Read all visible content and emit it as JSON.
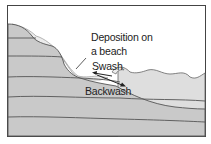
{
  "diagram": {
    "type": "cross-section",
    "labels": {
      "deposition": [
        "Deposition on",
        "a beach"
      ],
      "swash": "Swash",
      "backwash": "Backwash"
    },
    "colors": {
      "rock": "#c9c9c9",
      "sea": "#dedede",
      "beach_deposit": "#ececec",
      "line": "#555555",
      "border": "#444444",
      "background": "#ffffff"
    }
  }
}
